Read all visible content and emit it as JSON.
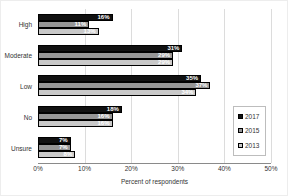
{
  "chart_data": {
    "type": "bar",
    "orientation": "horizontal",
    "title": "",
    "xlabel": "Percent of respondents",
    "ylabel": "",
    "xlim": [
      0,
      50
    ],
    "x_ticks": [
      "0%",
      "10%",
      "20%",
      "30%",
      "40%",
      "50%"
    ],
    "x_tick_values": [
      0,
      10,
      20,
      30,
      40,
      50
    ],
    "grid": true,
    "legend_position": "right",
    "categories": [
      "High",
      "Moderate",
      "Low",
      "No",
      "Unsure"
    ],
    "series": [
      {
        "name": "2017",
        "color": "#111111",
        "values": [
          16,
          31,
          35,
          18,
          7
        ]
      },
      {
        "name": "2015",
        "color": "#969696",
        "values": [
          11,
          29,
          37,
          16,
          7
        ]
      },
      {
        "name": "2013",
        "color": "#c9c9c9",
        "values": [
          13,
          29,
          34,
          16,
          8
        ]
      }
    ],
    "data_labels": [
      [
        "16%",
        "31%",
        "35%",
        "18%",
        "7%"
      ],
      [
        "11%",
        "29%",
        "37%",
        "16%",
        "7%"
      ],
      [
        "13%",
        "29%",
        "34%",
        "16%",
        "8%"
      ]
    ],
    "data_label_color": "#ffffff"
  }
}
